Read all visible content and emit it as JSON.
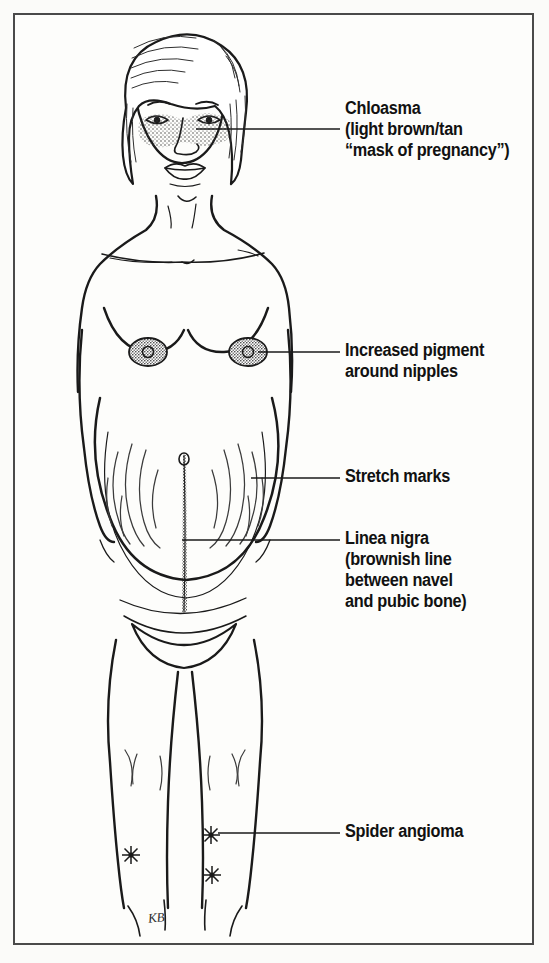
{
  "figure": {
    "artist_signature": "KB",
    "background_color": "#fbfbf9",
    "border_color": "#4a4a4a",
    "ink_color": "#1a1a1a"
  },
  "labels": [
    {
      "id": "chloasma",
      "lines": [
        "Chloasma",
        "(light brown/tan",
        "“mask of pregnancy”)"
      ],
      "text": "Chloasma\n(light brown/tan\n“mask of pregnancy”)",
      "target": "face-cheeks",
      "leader": {
        "x1": 196,
        "y1": 129,
        "x2": 340,
        "y2": 129
      }
    },
    {
      "id": "increased-pigment",
      "lines": [
        "Increased pigment",
        "around nipples"
      ],
      "text": "Increased pigment\naround nipples",
      "target": "right-areola",
      "leader": {
        "x1": 258,
        "y1": 352,
        "x2": 340,
        "y2": 352
      }
    },
    {
      "id": "stretch-marks",
      "lines": [
        "Stretch marks"
      ],
      "text": "Stretch marks",
      "target": "abdomen-striae",
      "leader": {
        "x1": 251,
        "y1": 478,
        "x2": 340,
        "y2": 478
      }
    },
    {
      "id": "linea-nigra",
      "lines": [
        "Linea nigra",
        "(brownish line",
        "between navel",
        "and pubic bone)"
      ],
      "text": "Linea nigra\n(brownish line\nbetween navel\nand pubic bone)",
      "target": "abdomen-midline",
      "leader": {
        "x1": 182,
        "y1": 540,
        "x2": 340,
        "y2": 540
      }
    },
    {
      "id": "spider-angioma",
      "lines": [
        "Spider angioma"
      ],
      "text": "Spider angioma",
      "target": "left-thigh-lesion",
      "leader": {
        "x1": 218,
        "y1": 833,
        "x2": 340,
        "y2": 833
      }
    }
  ],
  "findings": [
    {
      "name": "chloasma",
      "location": "cheeks and nose bridge",
      "appearance": "stippled mask"
    },
    {
      "name": "increased pigment",
      "location": "areolae",
      "appearance": "darkened stipple"
    },
    {
      "name": "stretch marks",
      "location": "abdomen flanks",
      "appearance": "curved striae arcs"
    },
    {
      "name": "linea nigra",
      "location": "navel to pubis",
      "appearance": "vertical stippled line"
    },
    {
      "name": "spider angioma",
      "location": "thighs",
      "appearance": "star burst",
      "count": 3
    }
  ]
}
